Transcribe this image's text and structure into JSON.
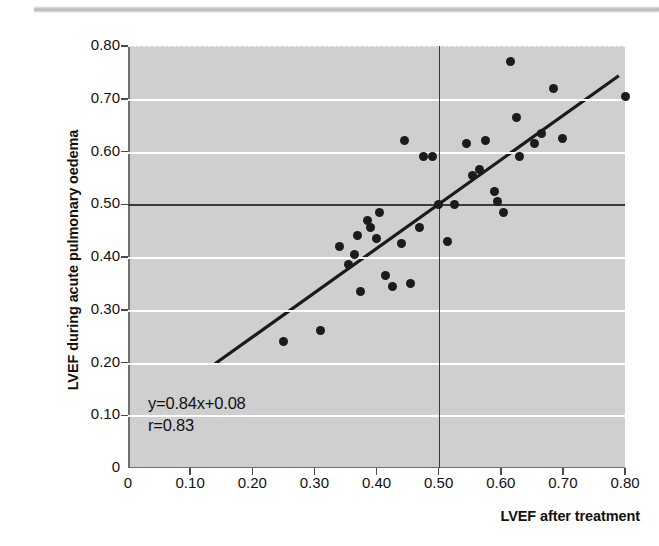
{
  "figure": {
    "top_rule_name": "decorative-top-rule"
  },
  "chart_data": {
    "type": "scatter",
    "title": "",
    "xlabel": "LVEF after treatment",
    "ylabel": "LVEF during acute pulmonary oedema",
    "xlim": [
      0,
      0.8
    ],
    "ylim": [
      0,
      0.8
    ],
    "grid": true,
    "legend_position": "none",
    "x_ticks": [
      "0",
      "0.10",
      "0.20",
      "0.30",
      "0.40",
      "0.50",
      "0.60",
      "0.70",
      "0.80"
    ],
    "x_tick_values": [
      0,
      0.1,
      0.2,
      0.3,
      0.4,
      0.5,
      0.6,
      0.7,
      0.8
    ],
    "y_ticks": [
      "0",
      "0.10",
      "0.20",
      "0.30",
      "0.40",
      "0.50",
      "0.60",
      "0.70",
      "0.80"
    ],
    "y_tick_values": [
      0,
      0.1,
      0.2,
      0.3,
      0.4,
      0.5,
      0.6,
      0.7,
      0.8
    ],
    "reference_lines": {
      "vertical_x": 0.5,
      "horizontal_y": 0.5
    },
    "annotations": {
      "equation": "y=0.84x+0.08",
      "correlation": "r=0.83"
    },
    "fit_line": {
      "slope": 0.84,
      "intercept": 0.08,
      "x_start": 0.14,
      "x_end": 0.79
    },
    "points": [
      [
        0.25,
        0.24
      ],
      [
        0.31,
        0.26
      ],
      [
        0.34,
        0.42
      ],
      [
        0.355,
        0.385
      ],
      [
        0.365,
        0.405
      ],
      [
        0.37,
        0.44
      ],
      [
        0.375,
        0.335
      ],
      [
        0.385,
        0.47
      ],
      [
        0.39,
        0.455
      ],
      [
        0.4,
        0.435
      ],
      [
        0.405,
        0.485
      ],
      [
        0.415,
        0.365
      ],
      [
        0.425,
        0.345
      ],
      [
        0.44,
        0.425
      ],
      [
        0.445,
        0.62
      ],
      [
        0.455,
        0.35
      ],
      [
        0.47,
        0.455
      ],
      [
        0.475,
        0.59
      ],
      [
        0.49,
        0.59
      ],
      [
        0.5,
        0.5
      ],
      [
        0.515,
        0.43
      ],
      [
        0.525,
        0.5
      ],
      [
        0.545,
        0.615
      ],
      [
        0.555,
        0.555
      ],
      [
        0.565,
        0.565
      ],
      [
        0.575,
        0.62
      ],
      [
        0.59,
        0.525
      ],
      [
        0.595,
        0.505
      ],
      [
        0.605,
        0.485
      ],
      [
        0.615,
        0.77
      ],
      [
        0.625,
        0.665
      ],
      [
        0.63,
        0.59
      ],
      [
        0.655,
        0.615
      ],
      [
        0.665,
        0.635
      ],
      [
        0.685,
        0.72
      ],
      [
        0.7,
        0.625
      ],
      [
        0.8,
        0.705
      ]
    ]
  }
}
